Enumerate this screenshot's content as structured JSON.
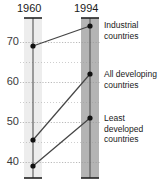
{
  "chart_data": {
    "type": "line",
    "title": "",
    "subtitle": "",
    "xlabel": "",
    "ylabel": "",
    "categories": [
      "1960",
      "1994"
    ],
    "x": [
      1960,
      1994
    ],
    "ylim": [
      36,
      76
    ],
    "yticks": [
      40,
      50,
      60,
      70
    ],
    "ytick_labels": [
      "40",
      "50",
      "60",
      "70"
    ],
    "minor_gridlines": [
      45,
      55,
      65
    ],
    "grid": true,
    "grid_style": "dotted",
    "legend_position": "right-inline",
    "series": [
      {
        "name": "Industrial countries",
        "label_lines": "Industrial\ncountries",
        "values": [
          69,
          74
        ],
        "color": "#444444"
      },
      {
        "name": "All developing countries",
        "label_lines": "All developing\ncountries",
        "values": [
          45.5,
          62
        ],
        "color": "#444444"
      },
      {
        "name": "Least developed countries",
        "label_lines": "Least\ndeveloped\ncountries",
        "values": [
          39,
          51
        ],
        "color": "#444444"
      }
    ],
    "columns": [
      {
        "year": "1960",
        "band_color": "#ededed"
      },
      {
        "year": "1994",
        "band_color": "#b4b4b4"
      }
    ]
  },
  "colors": {
    "line": "#444444",
    "marker": "#111111",
    "axis": "#555555",
    "grid": "#9a9a9a",
    "text": "#1a1a1a",
    "band_light": "#ededed",
    "band_dark": "#b4b4b4",
    "background": "#ffffff"
  }
}
